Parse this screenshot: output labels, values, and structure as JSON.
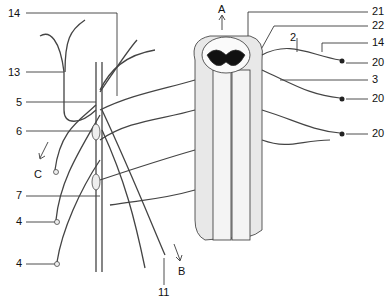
{
  "diagram": {
    "labels": [
      {
        "id": "l14a",
        "text": "14",
        "x": 8,
        "y": 9
      },
      {
        "id": "l13",
        "text": "13",
        "x": 8,
        "y": 68
      },
      {
        "id": "l5",
        "text": "5",
        "x": 16,
        "y": 98
      },
      {
        "id": "l6",
        "text": "6",
        "x": 16,
        "y": 127
      },
      {
        "id": "lC",
        "text": "C",
        "x": 34,
        "y": 170
      },
      {
        "id": "l7",
        "text": "7",
        "x": 16,
        "y": 191
      },
      {
        "id": "l4a",
        "text": "4",
        "x": 16,
        "y": 217
      },
      {
        "id": "l4b",
        "text": "4",
        "x": 16,
        "y": 259
      },
      {
        "id": "lB",
        "text": "B",
        "x": 178,
        "y": 268
      },
      {
        "id": "l11",
        "text": "11",
        "x": 158,
        "y": 288
      },
      {
        "id": "lA",
        "text": "A",
        "x": 219,
        "y": 6
      },
      {
        "id": "l21",
        "text": "21",
        "x": 374,
        "y": 7
      },
      {
        "id": "l22",
        "text": "22",
        "x": 374,
        "y": 21
      },
      {
        "id": "l2",
        "text": "2",
        "x": 290,
        "y": 33
      },
      {
        "id": "l14b",
        "text": "14",
        "x": 374,
        "y": 38
      },
      {
        "id": "l20a",
        "text": "20",
        "x": 374,
        "y": 58
      },
      {
        "id": "l3",
        "text": "3",
        "x": 374,
        "y": 75
      },
      {
        "id": "l20b",
        "text": "20",
        "x": 374,
        "y": 94
      },
      {
        "id": "l20c",
        "text": "20",
        "x": 374,
        "y": 129
      }
    ],
    "arrows": [
      {
        "name": "A",
        "direction": "up"
      },
      {
        "name": "B",
        "direction": "down-right"
      },
      {
        "name": "C",
        "direction": "down-left"
      }
    ]
  }
}
